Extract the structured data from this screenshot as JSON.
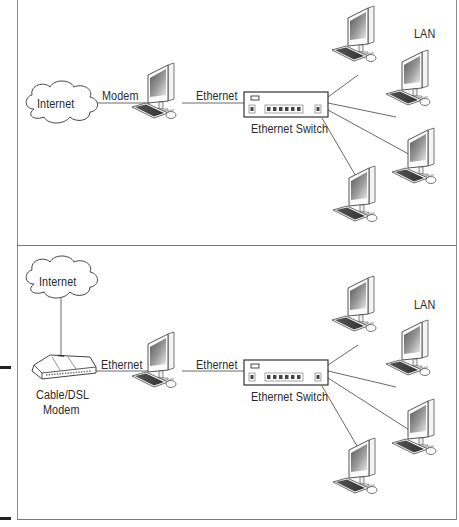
{
  "panels": [
    {
      "id": "top",
      "description": "Single computer with modem connected to Internet and Ethernet switch to LAN",
      "labels": {
        "internet": "Internet",
        "modem_link": "Modem",
        "ethernet_link": "Ethernet",
        "switch": "Ethernet Switch",
        "lan": "LAN"
      },
      "nodes": [
        "internet-cloud",
        "host-computer",
        "ethernet-switch",
        "lan-computer-1",
        "lan-computer-2",
        "lan-computer-3",
        "lan-computer-4"
      ]
    },
    {
      "id": "bottom",
      "description": "Cable/DSL modem connected to Internet, computer with Ethernet to switch and LAN",
      "labels": {
        "internet": "Internet",
        "modem_link": "Ethernet",
        "ethernet_link": "Ethernet",
        "modem_line1": "Cable/DSL",
        "modem_line2": "Modem",
        "switch": "Ethernet Switch",
        "lan": "LAN"
      },
      "nodes": [
        "internet-cloud",
        "cable-dsl-modem",
        "host-computer",
        "ethernet-switch",
        "lan-computer-1",
        "lan-computer-2",
        "lan-computer-3",
        "lan-computer-4"
      ]
    }
  ],
  "colors": {
    "frame": "#8a8a8a",
    "line": "#6a6a6a",
    "text": "#2a2a2a",
    "margin_mark": "#222222"
  }
}
